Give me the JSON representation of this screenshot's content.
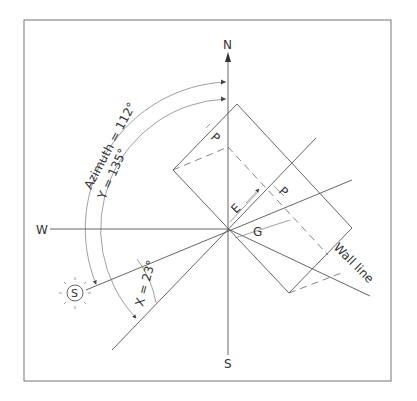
{
  "diagram": {
    "compass": {
      "north": "N",
      "south": "S",
      "west": "W"
    },
    "sun_symbol": "S",
    "angles": {
      "azimuth": "Azimuth = 112°",
      "y_angle": "Y = 135°",
      "x_angle": "X = 23°"
    },
    "dimensions": {
      "p_top": "P",
      "p_right": "P",
      "e": "E",
      "g": "G"
    },
    "wall_label": "Wall line",
    "colors": {
      "line": "#555555",
      "text": "#333333",
      "background": "#ffffff"
    }
  }
}
